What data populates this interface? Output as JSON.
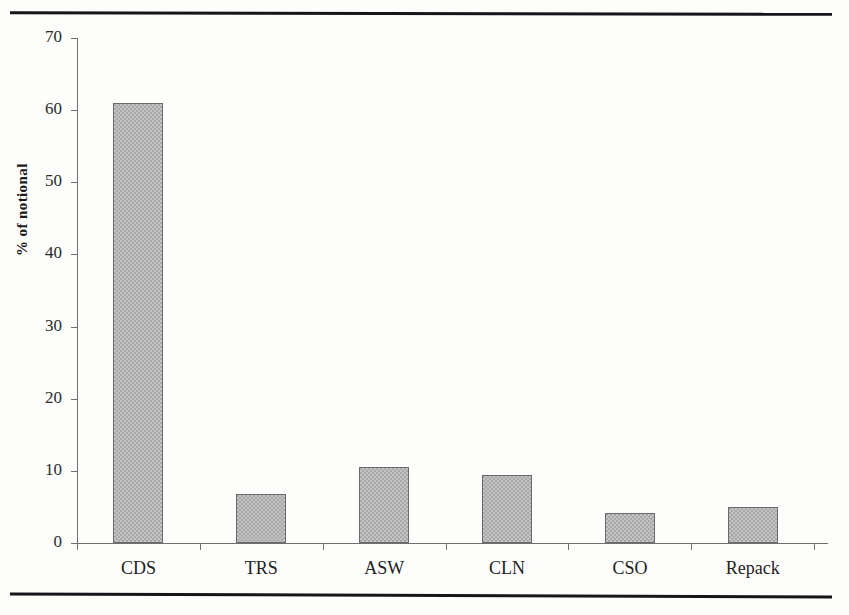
{
  "figure": {
    "rules": [
      "top-rule",
      "bottom-rule"
    ]
  },
  "chart_data": {
    "type": "bar",
    "title": "",
    "subtitle": "",
    "xlabel": "",
    "ylabel": "% of notional",
    "categories": [
      "CDS",
      "TRS",
      "ASW",
      "CLN",
      "CSO",
      "Repack"
    ],
    "values": [
      61,
      6.8,
      10.6,
      9.4,
      4.2,
      5.0
    ],
    "series": [
      {
        "name": "% of notional",
        "values": [
          61,
          6.8,
          10.6,
          9.4,
          4.2,
          5.0
        ]
      }
    ],
    "ylim": [
      0,
      70
    ],
    "ytick_labels": [
      "0",
      "10",
      "20",
      "30",
      "40",
      "50",
      "60",
      "70"
    ],
    "ytick_values": [
      0,
      10,
      20,
      30,
      40,
      50,
      60,
      70
    ],
    "grid": false,
    "legend": false,
    "legend_position": "none",
    "bar_fill_color": "#a9a9a9",
    "bar_border_color": "#6a6a6a",
    "axis_color": "#6f6f6f",
    "text_color": "#222222"
  }
}
